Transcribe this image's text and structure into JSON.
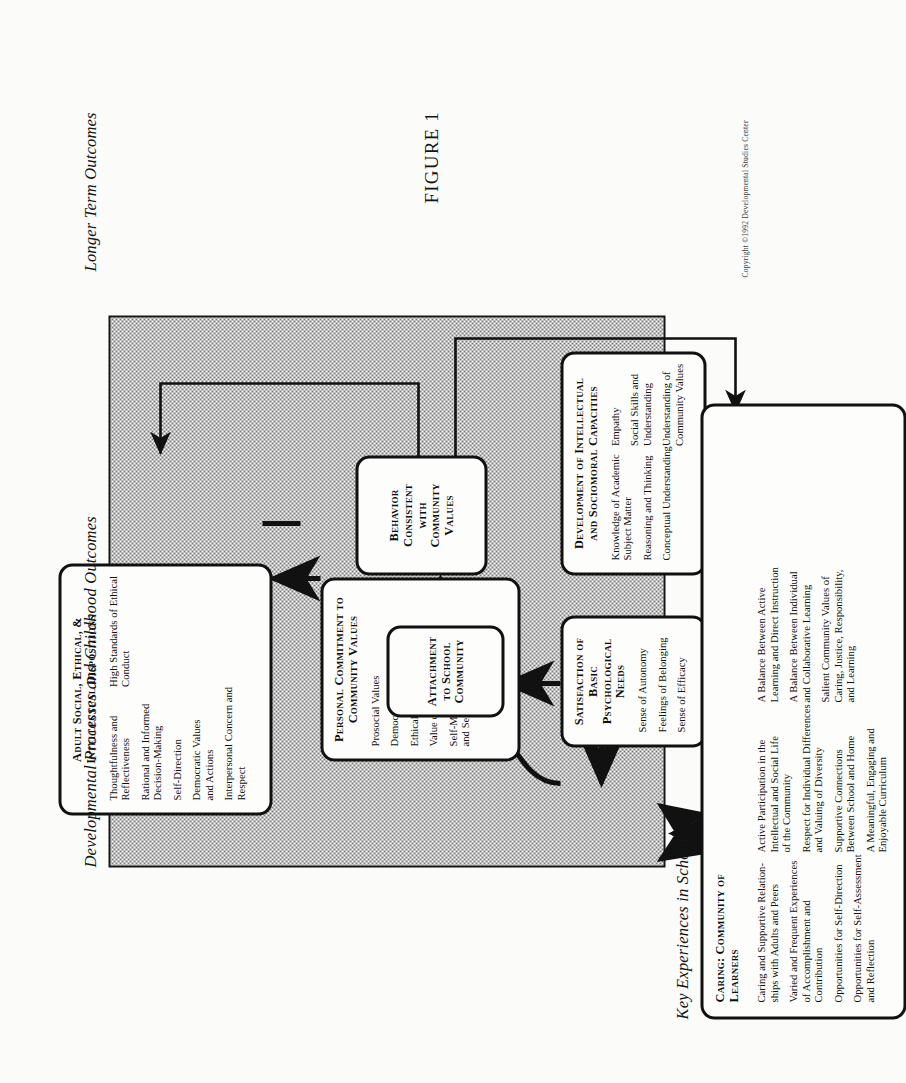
{
  "figure": {
    "caption": "FIGURE 1",
    "copyright": "Copyright ©1992 Developmental Studies Center"
  },
  "section_headers": {
    "key_experiences": "Key Experiences in School",
    "developmental": "Developmental Processes and Childhood Outcomes",
    "longer_term": "Longer Term Outcomes"
  },
  "boxes": {
    "caring_community": {
      "title": "Caring: Community of Learners",
      "items": [
        "Caring and Supportive Relation-\nships with Adults and Peers",
        "Varied and Frequent Experiences\nof Accomplishment and\nContribution",
        "Opportunities for Self-Direction",
        "Opportunities for Self-Assessment\nand Reflection",
        "Active Participation in the\nIntellectual and Social Life\nof the Community",
        "Respect for Individual Differences\nand Valuing of Diversity",
        "Supportive Connections\nBetween School and Home",
        "A Meaningful, Engaging and\nEnjoyable Curriculum",
        "A Balance Between Active\nLearning and Direct Instruction",
        "A Balance Between Individual\nand Collaborative Learning",
        "Salient Community Values of\nCaring, Justice, Responsibility,\nand Learning"
      ]
    },
    "satisfaction_needs": {
      "title": "Satisfaction of Basic Psychological Needs",
      "items": [
        "Sense of Autonomy",
        "Feelings of Belonging",
        "Sense of Efficacy"
      ]
    },
    "development_capacities": {
      "title": "Development of Intellectual and Sociomoral Capacities",
      "items": [
        "Knowledge of Academic\nSubject Matter",
        "Reasoning and Thinking",
        "Conceptual Understanding",
        "Empathy",
        "Social Skills and\nUnderstanding",
        "Understanding of\nCommunity Values"
      ]
    },
    "attachment": {
      "title": "Attachment to School Community",
      "items": []
    },
    "personal_commitment": {
      "title": "Personal Commitment to Community Values",
      "items": [
        "Prosocial Values",
        "Democratic Values",
        "Ethical Values",
        "Value on Learning",
        "Self-Motivation\nand Self-Control"
      ]
    },
    "behavior_consistent": {
      "title": "Behavior Consistent with Community Values",
      "items": []
    },
    "adult_dispositions": {
      "title": "Adult Social, Ethical, & Intellectual Dispositions",
      "items": [
        "Thoughtfulness and\nReflectiveness",
        "Rational and Informed\nDecision-Making",
        "Self-Direction",
        "Democratic Values\nand Actions",
        "Interpersonal Concern and\nRespect",
        "High Standards of Ethical\nConduct"
      ]
    }
  },
  "colors": {
    "ink": "#111111",
    "paper": "#fbfbf9",
    "shade_dot": "#6e6e6e"
  }
}
